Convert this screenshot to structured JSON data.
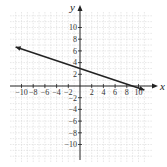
{
  "chart_data": {
    "type": "line",
    "title": "",
    "xlabel": "x",
    "ylabel": "y",
    "xlim": [
      -11.5,
      12
    ],
    "ylim": [
      -12,
      12
    ],
    "grid": true,
    "x_ticks": [
      -10,
      -8,
      -6,
      -4,
      -2,
      2,
      4,
      6,
      8,
      10
    ],
    "y_ticks": [
      10,
      8,
      6,
      4,
      2,
      -2,
      -4,
      -6,
      -8,
      -10
    ],
    "x_tick_labels": [
      "−10",
      "−8",
      "−6",
      "−4",
      "−2",
      "2",
      "4",
      "6",
      "8",
      "10"
    ],
    "y_tick_labels": [
      "10",
      "8",
      "6",
      "4",
      "2",
      "−2",
      "−4",
      "−6",
      "−8",
      "−10"
    ],
    "series": [
      {
        "name": "line",
        "equation": "y = -x/3 + 3",
        "x": [
          -11,
          11
        ],
        "y": [
          6.67,
          -0.67
        ],
        "arrows": "both",
        "color": "#222222"
      }
    ],
    "y_intercept": 3,
    "x_intercept": 9
  }
}
